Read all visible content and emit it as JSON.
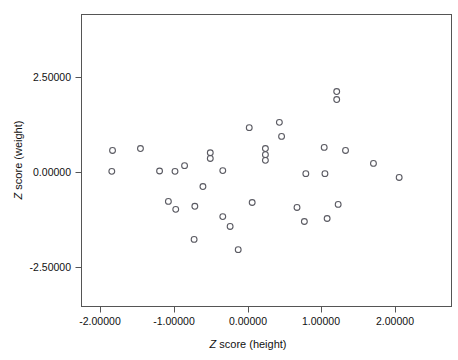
{
  "figure": {
    "background_color": "#ffffff",
    "frame_color": "#555555",
    "marker_color": "#5a5a62"
  },
  "axes": {
    "x_title_prefix": "Z",
    "x_title_rest": " score (height)",
    "y_title_prefix": "Z",
    "y_title_rest": " score (weight)",
    "x_ticks": [
      "-2.00000",
      "-1.00000",
      "0.00000",
      "1.00000",
      "2.00000"
    ],
    "y_ticks": [
      "2.50000",
      "0.00000",
      "-2.50000"
    ]
  },
  "chart_data": {
    "type": "scatter",
    "title": "",
    "xlabel": "Z score (height)",
    "ylabel": "Z score (weight)",
    "xlim": [
      -2.27,
      2.77
    ],
    "ylim": [
      -4.05,
      3.45
    ],
    "grid": false,
    "legend": "none",
    "xticks": [
      -2.0,
      -1.0,
      0.0,
      1.0,
      2.0
    ],
    "xticklabels": [
      "-2.00000",
      "-1.00000",
      "0.00000",
      "1.00000",
      "2.00000"
    ],
    "yticks": [
      2.5,
      0.0,
      -2.5
    ],
    "yticklabels": [
      "2.50000",
      "0.00000",
      "-2.50000"
    ],
    "marker": "open-circle",
    "n_points": 38,
    "series": [
      {
        "name": "cases",
        "points": [
          [
            -1.85,
            0.58
          ],
          [
            -1.86,
            0.03
          ],
          [
            -1.47,
            0.63
          ],
          [
            -1.21,
            0.04
          ],
          [
            -1.09,
            -0.76
          ],
          [
            -1.0,
            0.03
          ],
          [
            -0.99,
            -0.97
          ],
          [
            -0.87,
            0.18
          ],
          [
            -0.73,
            -0.89
          ],
          [
            -0.74,
            -1.76
          ],
          [
            -0.62,
            -0.37
          ],
          [
            -0.52,
            0.52
          ],
          [
            -0.52,
            0.37
          ],
          [
            -0.35,
            0.05
          ],
          [
            -0.35,
            -1.16
          ],
          [
            -0.25,
            -1.42
          ],
          [
            -0.14,
            -2.03
          ],
          [
            0.01,
            1.18
          ],
          [
            0.05,
            -0.79
          ],
          [
            0.23,
            0.63
          ],
          [
            0.23,
            0.47
          ],
          [
            0.23,
            0.32
          ],
          [
            0.42,
            1.32
          ],
          [
            0.45,
            0.95
          ],
          [
            0.66,
            -0.92
          ],
          [
            0.78,
            -0.03
          ],
          [
            0.76,
            -1.29
          ],
          [
            1.03,
            0.66
          ],
          [
            1.04,
            -0.03
          ],
          [
            1.07,
            -1.21
          ],
          [
            1.2,
            2.13
          ],
          [
            1.2,
            1.92
          ],
          [
            1.22,
            -0.84
          ],
          [
            1.32,
            0.58
          ],
          [
            1.7,
            0.24
          ],
          [
            2.05,
            -0.13
          ]
        ]
      }
    ]
  }
}
